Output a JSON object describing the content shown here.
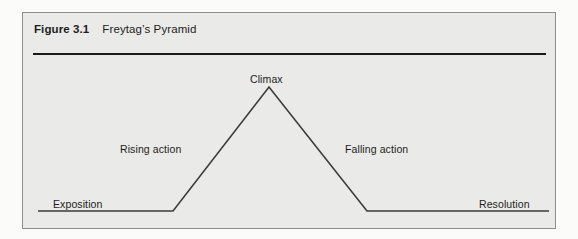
{
  "figure": {
    "caption_number": "Figure 3.1",
    "caption_title": "Freytag’s Pyramid"
  },
  "diagram": {
    "labels": {
      "climax": "Climax",
      "rising_action": "Rising action",
      "falling_action": "Falling action",
      "exposition": "Exposition",
      "resolution": "Resolution"
    }
  },
  "chart_data": {
    "type": "line",
    "title": "Freytag’s Pyramid",
    "xlabel": "",
    "ylabel": "",
    "grid": false,
    "legend": "none",
    "xlim": [
      0,
      534
    ],
    "ylim": [
      0,
      217
    ],
    "annotations": [
      {
        "text": "Climax",
        "x": 268,
        "y": 74
      },
      {
        "text": "Rising action",
        "x": 152,
        "y": 144
      },
      {
        "text": "Falling action",
        "x": 380,
        "y": 144
      },
      {
        "text": "Exposition",
        "x": 81,
        "y": 199
      },
      {
        "text": "Resolution",
        "x": 507,
        "y": 199
      }
    ],
    "series": [
      {
        "name": "Dramatic structure",
        "points": [
          {
            "x": 15,
            "y": 198,
            "stage": "Exposition"
          },
          {
            "x": 150,
            "y": 198,
            "stage": "Exposition end"
          },
          {
            "x": 246,
            "y": 74,
            "stage": "Climax"
          },
          {
            "x": 344,
            "y": 198,
            "stage": "Falling action end"
          },
          {
            "x": 526,
            "y": 198,
            "stage": "Resolution"
          }
        ]
      }
    ],
    "colors": {
      "line": "#3b3b3b",
      "rule": "#1a1a1a",
      "panel_background": "#eaeae8",
      "panel_border": "#8e8e8c",
      "page_background": "#fbfbfa",
      "text": "#1d1d1d"
    }
  }
}
